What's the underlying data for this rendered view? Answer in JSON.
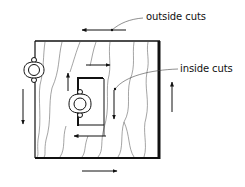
{
  "labels": {
    "outside": "outside cuts",
    "inside": "inside cuts"
  },
  "colors": {
    "ink": "#111111",
    "grain": "#555555",
    "background": "#ffffff"
  },
  "diagram": {
    "board": {
      "x": 35,
      "y": 41,
      "width": 124,
      "height": 117
    },
    "inner_cutout": {
      "x": 77,
      "y": 77,
      "width": 27,
      "height": 48
    },
    "outside_arrows": [
      {
        "direction": "left",
        "position": "top"
      },
      {
        "direction": "down",
        "position": "left"
      },
      {
        "direction": "right",
        "position": "bottom"
      },
      {
        "direction": "up",
        "position": "right"
      }
    ],
    "inside_arrows": [
      {
        "direction": "up",
        "position": "left"
      },
      {
        "direction": "right",
        "position": "top"
      },
      {
        "direction": "down",
        "position": "right"
      },
      {
        "direction": "left",
        "position": "bottom"
      }
    ],
    "clamps": [
      {
        "position": "outer-left-edge"
      },
      {
        "position": "inner-cutout-left-edge"
      }
    ]
  }
}
